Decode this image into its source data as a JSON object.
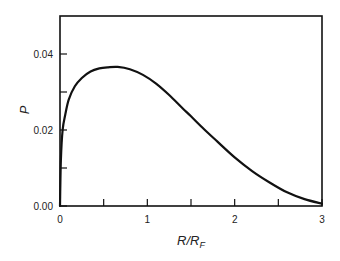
{
  "chart_data": {
    "type": "line",
    "title": "",
    "xlabel": "R/R_F",
    "xlabel_main": "R/R",
    "xlabel_sub": "F",
    "ylabel": "P",
    "xlim": [
      0,
      3
    ],
    "ylim": [
      0,
      0.05
    ],
    "x_ticks": [
      0,
      0.5,
      1,
      1.5,
      2,
      2.5,
      3
    ],
    "x_tick_labels": [
      "0",
      "",
      "1",
      "",
      "2",
      "",
      "3"
    ],
    "y_ticks": [
      0,
      0.01,
      0.02,
      0.03,
      0.04
    ],
    "y_tick_labels": [
      "0.00",
      "",
      "0.02",
      "",
      "0.04"
    ],
    "grid": false,
    "legend": null,
    "series": [
      {
        "name": "P",
        "x": [
          0.0,
          0.01,
          0.03,
          0.06,
          0.1,
          0.17,
          0.25,
          0.35,
          0.45,
          0.55,
          0.66,
          0.8,
          0.95,
          1.1,
          1.25,
          1.4,
          1.5,
          1.65,
          1.8,
          2.0,
          2.2,
          2.4,
          2.6,
          2.8,
          3.0
        ],
        "y": [
          0.0,
          0.012,
          0.02,
          0.024,
          0.028,
          0.0315,
          0.0337,
          0.0354,
          0.0362,
          0.0365,
          0.0366,
          0.036,
          0.0345,
          0.0322,
          0.0292,
          0.0258,
          0.0236,
          0.0202,
          0.017,
          0.0128,
          0.0092,
          0.0062,
          0.0036,
          0.0018,
          0.0006
        ]
      }
    ]
  }
}
